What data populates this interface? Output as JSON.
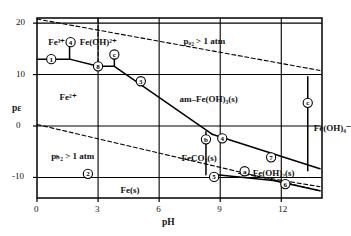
{
  "chart_data": {
    "type": "line",
    "title": "",
    "xlabel": "pH",
    "ylabel": "pε",
    "xlim": [
      0,
      14
    ],
    "ylim": [
      -14,
      21
    ],
    "xticks": [
      0,
      3,
      6,
      9,
      12
    ],
    "yticks": [
      20,
      10,
      0,
      -10
    ],
    "grid": true,
    "series": [
      {
        "name": "Fe3+/Fe2+ boundary (segment 1)",
        "style": "solid",
        "points": [
          [
            0,
            13.0
          ],
          [
            1.6,
            13.0
          ]
        ]
      },
      {
        "name": "Fe(OH)2+ / Fe2+ boundary (segment 4)",
        "style": "solid",
        "points": [
          [
            1.6,
            13.0
          ],
          [
            3.0,
            11.6
          ]
        ]
      },
      {
        "name": "am-Fe(OH)3(s) / Fe2+ boundary (segment 3)",
        "style": "solid",
        "points": [
          [
            3.0,
            11.6
          ],
          [
            3.8,
            11.6
          ],
          [
            8.6,
            -1.6
          ]
        ]
      },
      {
        "name": "am-Fe(OH)3(s) / FeCO3(s) boundary (segment 7)",
        "style": "solid",
        "points": [
          [
            8.6,
            -1.6
          ],
          [
            13.9,
            -8.3
          ]
        ]
      },
      {
        "name": "FeCO3(s) / Fe(s) boundary (segment 5)",
        "style": "solid",
        "points": [
          [
            8.6,
            -9.4
          ],
          [
            11.6,
            -10.6
          ],
          [
            13.9,
            -12.6
          ]
        ]
      },
      {
        "name": "Fe(OH)2(s) boundary (segment 6 dashed)",
        "style": "dashed",
        "points": [
          [
            9.9,
            -9.2
          ],
          [
            13.9,
            -11.8
          ]
        ]
      },
      {
        "name": "pO2 = 1 atm water stability upper limit",
        "style": "dashed",
        "points": [
          [
            0.0,
            20.8
          ],
          [
            13.9,
            10.8
          ]
        ]
      },
      {
        "name": "pH2 = 1 atm water stability lower limit",
        "style": "dashed",
        "points": [
          [
            0.0,
            0.3
          ],
          [
            13.9,
            -12.6
          ]
        ]
      },
      {
        "name": "marker-c vertical tie at pH 13.3",
        "style": "solid",
        "points": [
          [
            13.3,
            9.6
          ],
          [
            13.3,
            -8.7
          ]
        ]
      },
      {
        "name": "marker-b vertical tie at pH 8.3",
        "style": "solid",
        "points": [
          [
            8.3,
            -1.1
          ],
          [
            8.3,
            -9.5
          ]
        ]
      },
      {
        "name": "vertical tie at pH 1.6",
        "style": "solid",
        "points": [
          [
            1.6,
            16.2
          ],
          [
            1.6,
            13.0
          ]
        ]
      },
      {
        "name": "vertical dashed tie at pH 3.0",
        "style": "dashed",
        "points": [
          [
            3.0,
            20.8
          ],
          [
            3.0,
            11.6
          ]
        ]
      },
      {
        "name": "marker-c tie at pH 3.8",
        "style": "solid",
        "points": [
          [
            3.8,
            14.0
          ],
          [
            3.8,
            11.6
          ]
        ]
      }
    ],
    "region_labels": [
      {
        "id": "fe3plus",
        "text": "Fe³⁺",
        "x": 0.55,
        "y": 16.2
      },
      {
        "id": "feoh2plus",
        "text": "Fe(OH)²⁺",
        "x": 2.1,
        "y": 16.2
      },
      {
        "id": "fe2plus",
        "text": "Fe²⁺",
        "x": 1.1,
        "y": 5.5
      },
      {
        "id": "am-feoh3",
        "text": "am–Fe(OH)₃(s)",
        "x": 7.0,
        "y": 5.0
      },
      {
        "id": "feoh4minus",
        "text": "Fe(OH)₄⁻",
        "x": 13.6,
        "y": -0.5
      },
      {
        "id": "feco3",
        "text": "FeCO₃(s)",
        "x": 7.1,
        "y": -6.4
      },
      {
        "id": "feoh2s",
        "text": "Fe(OH)₂(s)",
        "x": 10.6,
        "y": -9.4
      },
      {
        "id": "fes",
        "text": "Fe(s)",
        "x": 4.1,
        "y": -12.7
      },
      {
        "id": "po2",
        "text": "pₒ₂ > 1 atm",
        "x": 7.2,
        "y": 16.4
      },
      {
        "id": "ph2",
        "text": "pₕ₂ > 1 atm",
        "x": 0.7,
        "y": -6.0
      }
    ],
    "markers": [
      {
        "label": "1",
        "x": 0.7,
        "y": 13.0
      },
      {
        "label": "4",
        "x": 1.65,
        "y": 16.3
      },
      {
        "label": "8",
        "x": 3.0,
        "y": 11.6
      },
      {
        "label": "c",
        "x": 3.8,
        "y": 13.9
      },
      {
        "label": "3",
        "x": 5.1,
        "y": 8.7
      },
      {
        "label": "c",
        "x": 13.3,
        "y": 4.5
      },
      {
        "label": "b",
        "x": 8.3,
        "y": -2.6
      },
      {
        "label": "4",
        "x": 9.1,
        "y": -2.4
      },
      {
        "label": "7",
        "x": 11.5,
        "y": -6.1
      },
      {
        "label": "a",
        "x": 10.2,
        "y": -8.8
      },
      {
        "label": "5",
        "x": 8.7,
        "y": -9.9
      },
      {
        "label": "6",
        "x": 12.2,
        "y": -11.3
      },
      {
        "label": "2",
        "x": 2.5,
        "y": -9.3
      }
    ],
    "colors": {
      "line": "#000000",
      "grid": "#000000",
      "background": "#ffffff"
    }
  },
  "axis": {
    "xlabel": "pH",
    "ylabel": "pε",
    "xticks": [
      "0",
      "3",
      "6",
      "9",
      "12"
    ],
    "yticks": [
      "20",
      "10",
      "0",
      "-10"
    ]
  }
}
